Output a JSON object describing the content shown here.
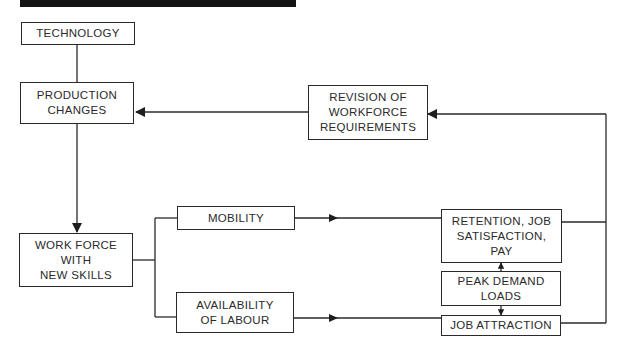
{
  "diagram": {
    "nodes": {
      "technology": "TECHNOLOGY",
      "production_changes": "PRODUCTION\nCHANGES",
      "revision": "REVISION OF\nWORKFORCE\nREQUIREMENTS",
      "workforce": "WORK FORCE\nWITH\nNEW SKILLS",
      "mobility": "MOBILITY",
      "availability": "AVAILABILITY\nOF LABOUR",
      "retention": "RETENTION, JOB\nSATISFACTION,\nPAY",
      "peak_demand": "PEAK DEMAND\nLOADS",
      "job_attraction": "JOB ATTRACTION"
    },
    "edges": [
      {
        "from": "technology",
        "to": "production_changes"
      },
      {
        "from": "revision",
        "to": "production_changes"
      },
      {
        "from": "production_changes",
        "to": "workforce"
      },
      {
        "from": "workforce",
        "to": "mobility"
      },
      {
        "from": "workforce",
        "to": "availability"
      },
      {
        "from": "mobility",
        "to": "retention"
      },
      {
        "from": "availability",
        "to": "job_attraction"
      },
      {
        "from": "peak_demand",
        "to": "retention"
      },
      {
        "from": "peak_demand",
        "to": "job_attraction"
      },
      {
        "from": "retention",
        "to": "revision"
      },
      {
        "from": "job_attraction",
        "to": "revision"
      }
    ]
  }
}
